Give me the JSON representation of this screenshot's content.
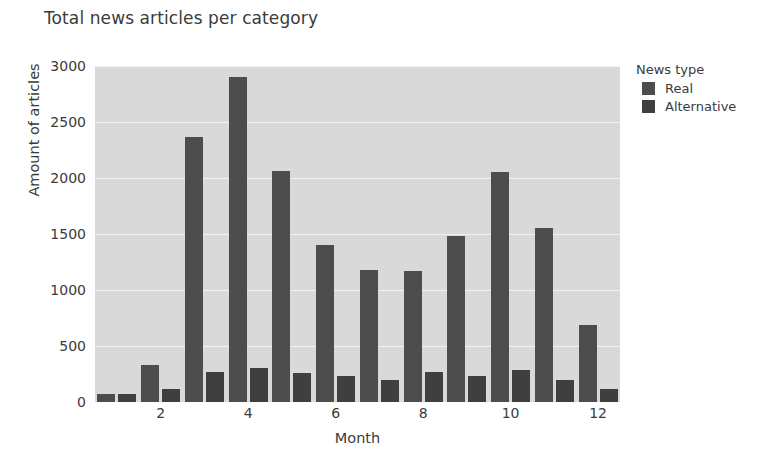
{
  "chart_data": {
    "type": "bar",
    "title": "Total news articles per category",
    "xlabel": "Month",
    "ylabel": "Amount of articles",
    "categories": [
      1,
      2,
      3,
      4,
      5,
      6,
      7,
      8,
      9,
      10,
      11,
      12
    ],
    "xticks": [
      "2",
      "4",
      "6",
      "8",
      "10",
      "12"
    ],
    "yticks": [
      "0",
      "500",
      "1000",
      "1500",
      "2000",
      "2500",
      "3000"
    ],
    "ylim": [
      0,
      3000
    ],
    "grid": true,
    "legend_position": "right",
    "legend_title": "News type",
    "series": [
      {
        "name": "Real",
        "color": "#4d4d4d",
        "values": [
          70,
          330,
          2370,
          2900,
          2060,
          1400,
          1180,
          1170,
          1480,
          2050,
          1550,
          690
        ]
      },
      {
        "name": "Alternative",
        "color": "#3f3f3f",
        "values": [
          75,
          120,
          270,
          300,
          255,
          235,
          195,
          270,
          230,
          285,
          200,
          115
        ]
      }
    ],
    "colors": {
      "plot_background": "#d9d9d9",
      "gridline": "#f2f2f2",
      "text": "#3b3b3b",
      "page_background": "#ffffff"
    }
  }
}
